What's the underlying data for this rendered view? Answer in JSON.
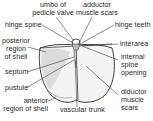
{
  "diagram": {
    "colors": {
      "ink": "#2a2a2a",
      "shell_fill": "#f2f2f2",
      "shell_stipple": "#9a9a9a",
      "background": "#ffffff"
    },
    "labels": {
      "umbo": {
        "line1": "umbo of",
        "line2": "pedicle valve"
      },
      "adductor": {
        "line1": "adductor",
        "line2": "muscle scars"
      },
      "hinge_spine": {
        "line1": "hinge spine"
      },
      "hinge_teeth": {
        "line1": "hinge teeth"
      },
      "posterior": {
        "line1": "posterior",
        "line2": "region",
        "line3": "of shell"
      },
      "interarea": {
        "line1": "interarea"
      },
      "internal_spine": {
        "line1": "internal",
        "line2": "spine",
        "line3": "opening"
      },
      "septum": {
        "line1": "septum"
      },
      "pustule": {
        "line1": "pustule"
      },
      "diductor": {
        "line1": "diductor",
        "line2": "muscle",
        "line3": "scars"
      },
      "anterior": {
        "line1": "anterior",
        "line2": "region of shell"
      },
      "vascular_trunk": {
        "line1": "vascular trunk"
      }
    }
  }
}
